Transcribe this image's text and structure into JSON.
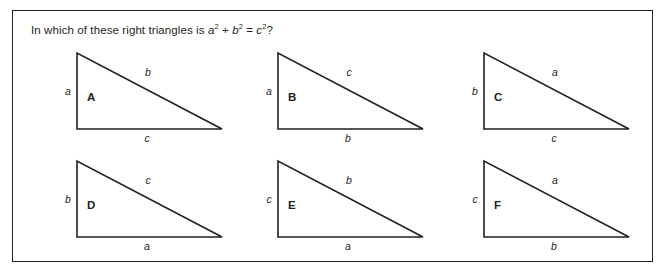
{
  "worksheet": {
    "question": {
      "prefix": "In which of these right triangles is ",
      "term_a": "a",
      "exp_a": "2",
      "plus": " + ",
      "term_b": "b",
      "exp_b": "2",
      "equals": " = ",
      "term_c": "c",
      "exp_c": "2",
      "suffix": "?"
    },
    "border_color": "#231f20",
    "ink_color": "#231f20",
    "background_color": "#ffffff",
    "triangles": [
      {
        "name": "A",
        "vertical_label": "a",
        "hypotenuse_label": "b",
        "base_label": "c"
      },
      {
        "name": "B",
        "vertical_label": "a",
        "hypotenuse_label": "c",
        "base_label": "b"
      },
      {
        "name": "C",
        "vertical_label": "b",
        "hypotenuse_label": "a",
        "base_label": "c"
      },
      {
        "name": "D",
        "vertical_label": "b",
        "hypotenuse_label": "c",
        "base_label": "a"
      },
      {
        "name": "E",
        "vertical_label": "c",
        "hypotenuse_label": "b",
        "base_label": "a"
      },
      {
        "name": "F",
        "vertical_label": "c",
        "hypotenuse_label": "a",
        "base_label": "b"
      }
    ]
  }
}
